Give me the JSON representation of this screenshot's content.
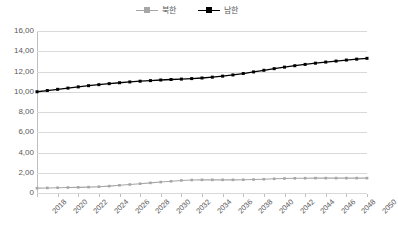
{
  "chart_data": {
    "type": "line",
    "title": "",
    "xlabel": "",
    "ylabel": "",
    "ylim": [
      0,
      1600
    ],
    "ytick_labels": [
      "16,00",
      "14,00",
      "12,00",
      "10,00",
      "8,00",
      "6,00",
      "4,00",
      "2,00",
      "0"
    ],
    "ytick_values": [
      1600,
      1400,
      1200,
      1000,
      800,
      600,
      400,
      200,
      0
    ],
    "grid": true,
    "legend_position": "top-center",
    "x": [
      2018,
      2019,
      2020,
      2021,
      2022,
      2023,
      2024,
      2025,
      2026,
      2027,
      2028,
      2029,
      2030,
      2031,
      2032,
      2033,
      2034,
      2035,
      2036,
      2037,
      2038,
      2039,
      2040,
      2041,
      2042,
      2043,
      2044,
      2045,
      2046,
      2047,
      2048,
      2049,
      2050
    ],
    "xtick_labels": [
      "2018",
      "2020",
      "2022",
      "2024",
      "2026",
      "2028",
      "2030",
      "2032",
      "2034",
      "2036",
      "2038",
      "2040",
      "2042",
      "2044",
      "2046",
      "2048",
      "2050"
    ],
    "series": [
      {
        "name": "북한",
        "color": "#A6A6A6",
        "marker": "square",
        "values": [
          48,
          50,
          52,
          54,
          56,
          58,
          62,
          68,
          76,
          84,
          92,
          100,
          108,
          116,
          124,
          128,
          130,
          130,
          130,
          130,
          131,
          133,
          136,
          140,
          143,
          145,
          146,
          147,
          147,
          147,
          147,
          147,
          147
        ]
      },
      {
        "name": "남한",
        "color": "#000000",
        "marker": "square",
        "values": [
          1000,
          1012,
          1024,
          1036,
          1048,
          1060,
          1070,
          1080,
          1089,
          1097,
          1104,
          1110,
          1116,
          1121,
          1125,
          1130,
          1136,
          1144,
          1154,
          1166,
          1180,
          1196,
          1212,
          1228,
          1243,
          1257,
          1270,
          1282,
          1293,
          1303,
          1313,
          1322,
          1330
        ]
      }
    ]
  },
  "legend": {
    "items": [
      {
        "label": "북한",
        "color": "#A6A6A6"
      },
      {
        "label": "남한",
        "color": "#000000"
      }
    ]
  }
}
